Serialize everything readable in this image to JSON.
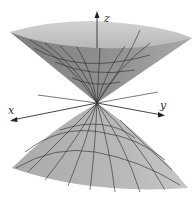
{
  "figure": {
    "type": "double-cone-surface",
    "axes": {
      "x_label": "x",
      "y_label": "y",
      "z_label": "z"
    },
    "colors": {
      "upper_rim": "#c4c4c4",
      "upper_outer": "#8a8a8a",
      "upper_inner": "#9e9e9e",
      "lower_surface": "#b4b4b4",
      "grid_lines": "#2a2a2a",
      "axis_lines": "#444444"
    }
  }
}
